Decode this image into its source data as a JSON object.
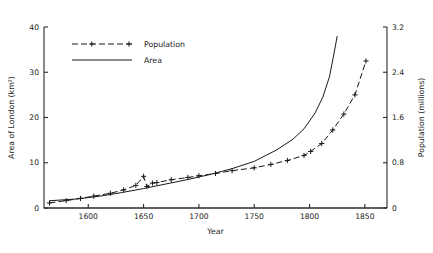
{
  "chart_data": {
    "type": "line",
    "title": "",
    "xlabel": "Year",
    "ylabel": "Area of London (km²)",
    "y2label": "Population (millions)",
    "xlim": [
      1560,
      1870
    ],
    "ylim": [
      0,
      40
    ],
    "y2lim": [
      0,
      3.2
    ],
    "grid": false,
    "legend_position": "upper-left-inside",
    "xticks": [
      1600,
      1650,
      1700,
      1750,
      1800,
      1850
    ],
    "xticklabels": [
      "1600",
      "1650",
      "1700",
      "1750",
      "1800",
      "1850"
    ],
    "yticks": [
      0,
      10,
      20,
      30,
      40
    ],
    "yticklabels": [
      "0",
      "10",
      "20",
      "30",
      "40"
    ],
    "y2ticks": [
      0,
      0.8,
      1.6,
      2.4,
      3.2
    ],
    "y2ticklabels": [
      "0",
      "0.8",
      "1.6",
      "2.4",
      "3.2"
    ],
    "series": [
      {
        "name": "Population",
        "axis": "right",
        "style": "dashed-with-plus-markers",
        "marker": "plus",
        "x": [
          1565,
          1580,
          1593,
          1605,
          1620,
          1632,
          1643,
          1650,
          1653,
          1658,
          1662,
          1675,
          1690,
          1700,
          1715,
          1730,
          1750,
          1765,
          1780,
          1795,
          1801,
          1811,
          1821,
          1831,
          1841,
          1851
        ],
        "values": [
          0.09,
          0.13,
          0.17,
          0.21,
          0.26,
          0.32,
          0.4,
          0.56,
          0.38,
          0.44,
          0.45,
          0.5,
          0.54,
          0.57,
          0.61,
          0.66,
          0.71,
          0.77,
          0.84,
          0.93,
          1.0,
          1.14,
          1.38,
          1.66,
          2.0,
          2.6
        ]
      },
      {
        "name": "Area",
        "axis": "left",
        "style": "solid",
        "marker": "none",
        "x": [
          1565,
          1590,
          1610,
          1630,
          1650,
          1670,
          1690,
          1710,
          1730,
          1750,
          1770,
          1785,
          1795,
          1805,
          1812,
          1818,
          1822,
          1825
        ],
        "values": [
          1.6,
          2.0,
          2.6,
          3.4,
          4.3,
          5.3,
          6.3,
          7.4,
          8.7,
          10.3,
          12.8,
          15.2,
          17.5,
          21.0,
          24.5,
          29.0,
          34.0,
          38.0
        ]
      }
    ],
    "annotations": [
      {
        "text": "plague-spike",
        "x": 1650,
        "note": "short upward tick in Population near 1650"
      }
    ]
  },
  "legend": {
    "items": [
      {
        "label": "Population"
      },
      {
        "label": "Area"
      }
    ]
  },
  "colors": {
    "line": "#1a1a1a",
    "axis": "#2b2b2b",
    "background": "#ffffff"
  }
}
